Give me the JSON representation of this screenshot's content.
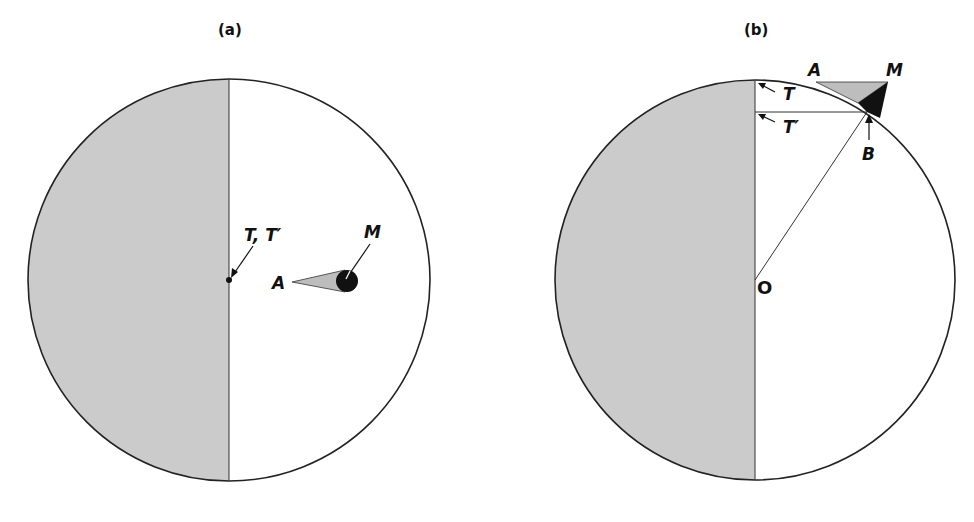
{
  "panels": [
    {
      "id": "a",
      "title": "(a)",
      "labels": {
        "tt": "T, T′",
        "m": "M",
        "a": "A"
      }
    },
    {
      "id": "b",
      "title": "(b)",
      "labels": {
        "a": "A",
        "m": "M",
        "t": "T",
        "tp": "T′",
        "b": "B",
        "o": "O"
      }
    }
  ],
  "colors": {
    "shade": "#c9c9c9",
    "cone": "#bdbdbd",
    "dark": "#111111",
    "line": "#222222"
  }
}
